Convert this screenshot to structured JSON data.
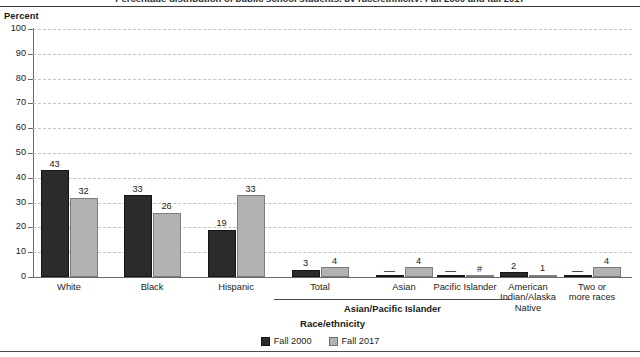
{
  "figure": {
    "title_clipped": "Percentage distribution of public school students, by race/ethnicity: Fall 2000 and fall 2017",
    "percent_axis_label": "Percent",
    "xaxis_title": "Race/ethnicity",
    "group_bracket_label": "Asian/Pacific Islander"
  },
  "legend": {
    "items": [
      {
        "label": "Fall 2000",
        "color": "#2b2b2b",
        "key": "series-fall-2000"
      },
      {
        "label": "Fall 2017",
        "color": "#b2b2b2",
        "key": "series-fall-2017"
      }
    ]
  },
  "chart_data": {
    "type": "bar",
    "title": "Percentage distribution of public school students, by race/ethnicity: Fall 2000 and fall 2017",
    "xlabel": "Race/ethnicity",
    "ylabel": "Percent",
    "ylim": [
      0,
      100
    ],
    "yticks": [
      0,
      10,
      20,
      30,
      40,
      50,
      60,
      70,
      80,
      90,
      100
    ],
    "ytick_labels": [
      "0",
      "10",
      "20",
      "30",
      "40",
      "50",
      "60",
      "70",
      "80",
      "90",
      "100"
    ],
    "grid": true,
    "legend_position": "bottom-center",
    "categories": [
      "White",
      "Black",
      "Hispanic",
      "Total",
      "Asian",
      "Pacific Islander",
      "American Indian/Alaska Native",
      "Two or more races"
    ],
    "category_display": [
      "White",
      "Black",
      "Hispanic",
      "Total",
      "Asian",
      "Pacific Islander",
      "American\nIndian/Alaska\nNative",
      "Two or\nmore races"
    ],
    "group_brackets": [
      {
        "label": "Asian/Pacific Islander",
        "categories": [
          "Total",
          "Asian",
          "Pacific Islander"
        ]
      }
    ],
    "series": [
      {
        "name": "Fall 2000",
        "color": "#2b2b2b",
        "values": [
          43,
          33,
          19,
          3,
          0,
          0,
          2,
          0
        ],
        "labels": [
          "43",
          "33",
          "19",
          "3",
          "—",
          "—",
          "2",
          "—"
        ]
      },
      {
        "name": "Fall 2017",
        "color": "#b2b2b2",
        "values": [
          32,
          26,
          33,
          4,
          4,
          0,
          1,
          4
        ],
        "labels": [
          "32",
          "26",
          "33",
          "4",
          "4",
          "#",
          "1",
          "4"
        ]
      }
    ]
  }
}
